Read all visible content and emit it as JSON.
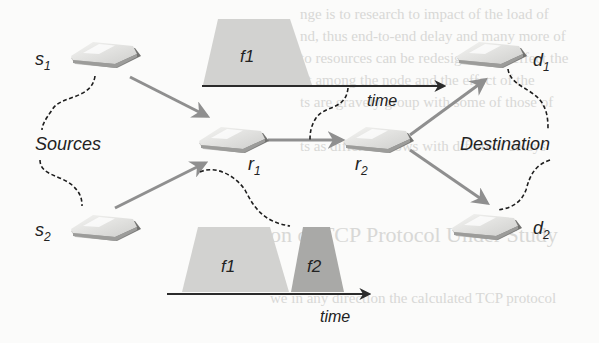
{
  "figure": {
    "nodes": {
      "s1": {
        "label": "s",
        "sub": "1"
      },
      "s2": {
        "label": "s",
        "sub": "2"
      },
      "r1": {
        "label": "r",
        "sub": "1"
      },
      "r2": {
        "label": "r",
        "sub": "2"
      },
      "d1": {
        "label": "d",
        "sub": "1"
      },
      "d2": {
        "label": "d",
        "sub": "2"
      }
    },
    "groups": {
      "sources": "Sources",
      "destination": "Destination"
    },
    "timeline_top": {
      "flow_label": "f1",
      "axis_label": "time"
    },
    "timeline_bottom": {
      "flow1_label": "f1",
      "flow2_label": "f2",
      "axis_label": "time"
    },
    "edges": [
      {
        "from": "s1",
        "to": "r1"
      },
      {
        "from": "s2",
        "to": "r1"
      },
      {
        "from": "r1",
        "to": "r2"
      },
      {
        "from": "r2",
        "to": "d1"
      },
      {
        "from": "r2",
        "to": "d2"
      }
    ],
    "colors": {
      "arrow": "#8f8f8f",
      "axis": "#2b2b2b",
      "flow1_fill": "#d2d2d0",
      "flow2_fill": "#a9a9a7",
      "router_top": "#e6e6e4",
      "router_side": "#9a9a98",
      "dashed": "#1e1e1e"
    }
  },
  "background_bleed": {
    "line1": "nge is to research to impact of the load of",
    "line2": "nd, thus end-to-end delay and many more of",
    "line3": "to resources can be redesigned and effect the",
    "line4": "nt among the node and the effect of the",
    "line5": "ts are gravely group with some of those of",
    "line6": "ts as different flows with different delays",
    "heading": "on of TCP Protocol Under Study",
    "line7": "we in any direction the calculated TCP protocol"
  }
}
